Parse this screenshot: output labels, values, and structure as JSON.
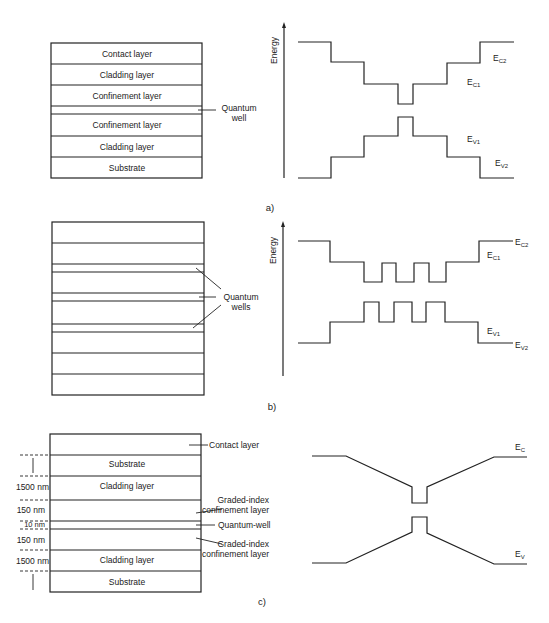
{
  "figure": {
    "panels": [
      {
        "id": "a",
        "label": "a)",
        "layer_stack": {
          "layers": [
            "Contact layer",
            "Cladding layer",
            "Confinement layer",
            "",
            "Confinement layer",
            "Cladding layer",
            "Substrate"
          ],
          "callout": "Quantum well",
          "callout_lines": [
            "Quantum",
            "well"
          ]
        },
        "band_diagram": {
          "axis_label": "Energy",
          "labels": {
            "ec2": {
              "main": "E",
              "sub": "C2"
            },
            "ec1": {
              "main": "E",
              "sub": "C1"
            },
            "ev1": {
              "main": "E",
              "sub": "V1"
            },
            "ev2": {
              "main": "E",
              "sub": "V2"
            }
          }
        }
      },
      {
        "id": "b",
        "label": "b)",
        "layer_stack": {
          "layer_count": 11,
          "callout_lines": [
            "Quantum",
            "wells"
          ]
        },
        "band_diagram": {
          "axis_label": "Energy",
          "labels": {
            "ec2": {
              "main": "E",
              "sub": "C2"
            },
            "ec1": {
              "main": "E",
              "sub": "C1"
            },
            "ev1": {
              "main": "E",
              "sub": "V1"
            },
            "ev2": {
              "main": "E",
              "sub": "V2"
            }
          }
        }
      },
      {
        "id": "c",
        "label": "c)",
        "layer_stack": {
          "layers": [
            "",
            "Substrate",
            "Cladding layer",
            "",
            "",
            "",
            "Cladding layer",
            "Substrate"
          ],
          "thickness_labels": [
            "1500 nm",
            "150 nm",
            "10 nm",
            "150 nm",
            "1500 nm"
          ],
          "callouts": {
            "contact": "Contact layer",
            "grin_top": [
              "Graded-index",
              "confinement layer"
            ],
            "qw": "Quantum-well",
            "grin_bottom": [
              "Graded-index",
              "confinement layer"
            ]
          }
        },
        "band_diagram": {
          "labels": {
            "ec": {
              "main": "E",
              "sub": "C"
            },
            "ev": {
              "main": "E",
              "sub": "V"
            }
          }
        }
      }
    ],
    "colors": {
      "line": "#222222",
      "background": "#ffffff"
    }
  }
}
